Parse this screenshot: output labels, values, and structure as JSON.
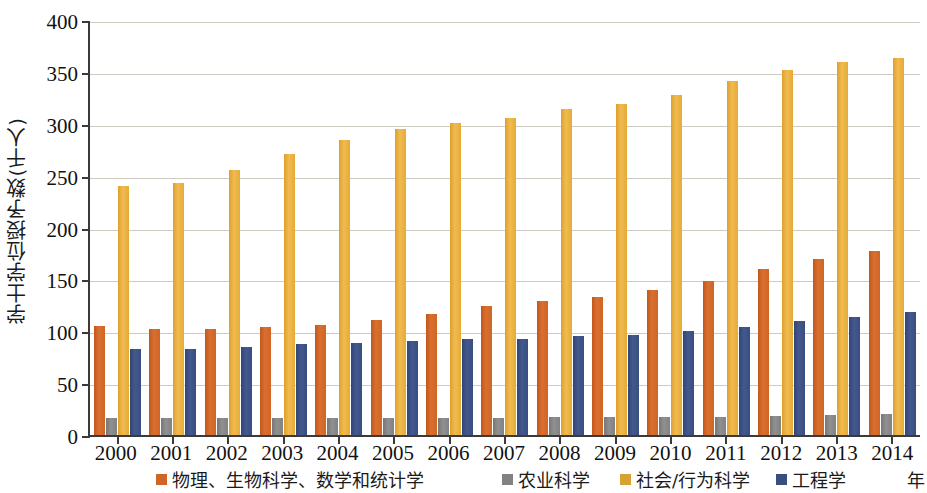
{
  "chart_data": {
    "type": "bar",
    "title": "",
    "xlabel": "年",
    "ylabel": "学士学位授予数(千人)",
    "ylim": [
      0,
      400
    ],
    "ytick_step": 50,
    "yticks": [
      "0",
      "50",
      "100",
      "150",
      "200",
      "250",
      "300",
      "350",
      "400"
    ],
    "grid": true,
    "legend_position": "bottom",
    "categories": [
      "2000",
      "2001",
      "2002",
      "2003",
      "2004",
      "2005",
      "2006",
      "2007",
      "2008",
      "2009",
      "2010",
      "2011",
      "2012",
      "2013",
      "2014"
    ],
    "series": [
      {
        "name": "物理、生物科学、数学和统计学",
        "color": "#cf6526",
        "values": [
          105,
          102,
          102,
          104,
          106,
          111,
          117,
          124,
          129,
          133,
          140,
          148,
          160,
          170,
          177
        ]
      },
      {
        "name": "农业科学",
        "color": "#828282",
        "values": [
          16,
          16,
          16,
          16,
          16,
          16,
          16,
          16,
          17,
          17,
          17,
          17,
          18,
          19,
          20
        ]
      },
      {
        "name": "社会/行为科学",
        "color": "#d7a233",
        "values": [
          240,
          243,
          255,
          271,
          284,
          295,
          301,
          306,
          314,
          319,
          328,
          341,
          352,
          360,
          363
        ]
      },
      {
        "name": "工程学",
        "color": "#3a4f80",
        "values": [
          83,
          83,
          85,
          88,
          89,
          91,
          93,
          93,
          95,
          96,
          100,
          104,
          110,
          114,
          119
        ]
      }
    ]
  },
  "axis": {
    "y_title": "学士学位授予数(千人)",
    "x_unit": "年"
  }
}
